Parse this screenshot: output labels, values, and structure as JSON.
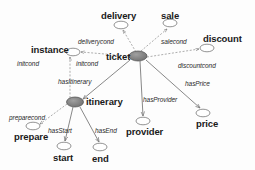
{
  "diagram": {
    "colors": {
      "hub_fill": "#808080",
      "hub_stroke": "#4d4d4d",
      "leaf_fill": "#ffffff",
      "leaf_stroke": "#666666",
      "solid_edge": "#7a7a7a",
      "dashed_edge": "#8a8a8a",
      "text": "#1a1a1a",
      "background": "#fdfdfd"
    },
    "nodes": [
      {
        "id": "ticket",
        "label": "ticket",
        "kind": "hub",
        "cx": 138,
        "cy": 56,
        "rx": 9,
        "ry": 5,
        "label_x": 106,
        "label_y": 52
      },
      {
        "id": "itinerary",
        "label": "itinerary",
        "kind": "hub",
        "cx": 75,
        "cy": 102,
        "rx": 8.5,
        "ry": 5,
        "label_x": 86,
        "label_y": 97
      },
      {
        "id": "delivery",
        "label": "delivery",
        "kind": "leaf",
        "cx": 121,
        "cy": 25,
        "rx": 7,
        "ry": 3.8,
        "label_x": 101,
        "label_y": 11
      },
      {
        "id": "sale",
        "label": "sale",
        "kind": "leaf",
        "cx": 170,
        "cy": 23,
        "rx": 7,
        "ry": 3.8,
        "label_x": 161,
        "label_y": 11
      },
      {
        "id": "discount",
        "label": "discount",
        "kind": "leaf",
        "cx": 207,
        "cy": 48,
        "rx": 7,
        "ry": 3.8,
        "label_x": 203,
        "label_y": 34
      },
      {
        "id": "instance",
        "label": "instance",
        "kind": "leaf",
        "cx": 73,
        "cy": 52,
        "rx": 7,
        "ry": 3.8,
        "label_x": 31,
        "label_y": 45
      },
      {
        "id": "prepare",
        "label": "prepare",
        "kind": "leaf",
        "cx": 33,
        "cy": 126,
        "rx": 7,
        "ry": 3.8,
        "label_x": 14,
        "label_y": 132
      },
      {
        "id": "start",
        "label": "start",
        "kind": "leaf",
        "cx": 64,
        "cy": 146,
        "rx": 7,
        "ry": 3.8,
        "label_x": 53,
        "label_y": 153
      },
      {
        "id": "end",
        "label": "end",
        "kind": "leaf",
        "cx": 100,
        "cy": 147,
        "rx": 7,
        "ry": 3.8,
        "label_x": 92,
        "label_y": 154
      },
      {
        "id": "provider",
        "label": "provider",
        "kind": "leaf",
        "cx": 143,
        "cy": 121,
        "rx": 7,
        "ry": 3.8,
        "label_x": 126,
        "label_y": 127
      },
      {
        "id": "price",
        "label": "price",
        "kind": "leaf",
        "cx": 203,
        "cy": 113,
        "rx": 7,
        "ry": 3.8,
        "label_x": 196,
        "label_y": 119
      }
    ],
    "edges": [
      {
        "id": "ticket-deliverycond",
        "label": "deliverycond",
        "style": "dashed",
        "from": "ticket",
        "to": "delivery",
        "x1": 136,
        "y1": 52,
        "x2": 123,
        "y2": 30,
        "label_x": 78,
        "label_y": 39
      },
      {
        "id": "ticket-salecond",
        "label": "salecond",
        "style": "dashed",
        "from": "ticket",
        "to": "sale",
        "x1": 141,
        "y1": 51,
        "x2": 167,
        "y2": 29,
        "label_x": 161,
        "label_y": 39
      },
      {
        "id": "ticket-discountcond",
        "label": "discountcond",
        "style": "dashed",
        "from": "ticket",
        "to": "discount",
        "x1": 147,
        "y1": 57,
        "x2": 199,
        "y2": 49,
        "label_x": 178,
        "label_y": 63
      },
      {
        "id": "ticket-initcond",
        "label": "initcond",
        "style": "dashed",
        "from": "ticket",
        "to": "instance",
        "x1": 129,
        "y1": 56,
        "x2": 81,
        "y2": 52,
        "label_x": 76,
        "label_y": 61
      },
      {
        "id": "itinerary-initcond",
        "label": "initcond",
        "style": "dashed",
        "from": "itinerary",
        "to": "instance",
        "x1": 70,
        "y1": 98,
        "x2": 70,
        "y2": 57,
        "label_x": 17,
        "label_y": 61
      },
      {
        "id": "itinerary-preparecond",
        "label": "preparecond",
        "style": "dashed",
        "from": "itinerary",
        "to": "prepare",
        "x1": 67,
        "y1": 104,
        "x2": 40,
        "y2": 124,
        "label_x": 9,
        "label_y": 115
      },
      {
        "id": "ticket-hasItinerary",
        "label": "hasItinerary",
        "style": "solid",
        "from": "ticket",
        "to": "itinerary",
        "x1": 130,
        "y1": 60,
        "x2": 83,
        "y2": 99,
        "label_x": 58,
        "label_y": 79
      },
      {
        "id": "ticket-hasProvider",
        "label": "hasProvider",
        "style": "solid",
        "from": "ticket",
        "to": "provider",
        "x1": 140,
        "y1": 61,
        "x2": 143,
        "y2": 116,
        "label_x": 143,
        "label_y": 97
      },
      {
        "id": "ticket-hasPrice",
        "label": "hasPrice",
        "style": "solid",
        "from": "ticket",
        "to": "price",
        "x1": 146,
        "y1": 60,
        "x2": 200,
        "y2": 108,
        "label_x": 185,
        "label_y": 81
      },
      {
        "id": "itinerary-hasStart",
        "label": "hasStart",
        "style": "solid",
        "from": "itinerary",
        "to": "start",
        "x1": 73,
        "y1": 107,
        "x2": 65,
        "y2": 141,
        "label_x": 48,
        "label_y": 128
      },
      {
        "id": "itinerary-hasEnd",
        "label": "hasEnd",
        "style": "solid",
        "from": "itinerary",
        "to": "end",
        "x1": 80,
        "y1": 107,
        "x2": 99,
        "y2": 142,
        "label_x": 95,
        "label_y": 128
      }
    ]
  }
}
